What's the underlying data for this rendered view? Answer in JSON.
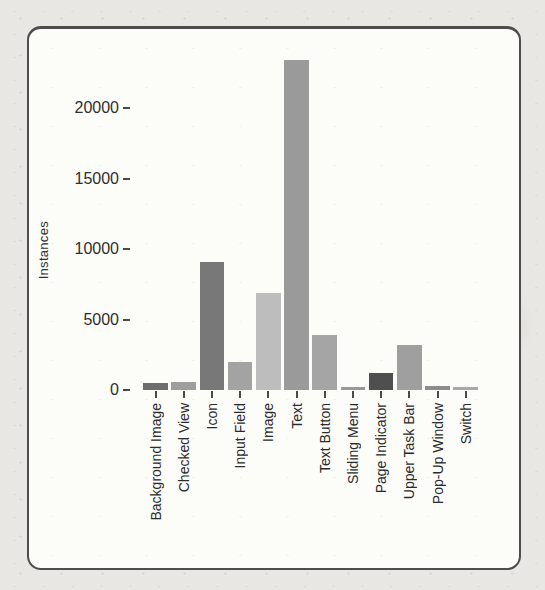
{
  "chart_data": {
    "type": "bar",
    "title": "",
    "xlabel": "",
    "ylabel": "Instances",
    "categories": [
      "Background Image",
      "Checked View",
      "Icon",
      "Input Field",
      "Image",
      "Text",
      "Text Button",
      "Sliding Menu",
      "Page Indicator",
      "Upper Task Bar",
      "Pop-Up Window",
      "Switch"
    ],
    "values": [
      500,
      600,
      9100,
      2000,
      6900,
      23400,
      3900,
      200,
      1200,
      3200,
      250,
      200
    ],
    "bar_colors": [
      "#6e6e6e",
      "#9e9e9e",
      "#787878",
      "#a3a3a3",
      "#bdbdbd",
      "#9a9a9a",
      "#a5a5a5",
      "#999999",
      "#4f4f4f",
      "#9f9f9f",
      "#8c8c8c",
      "#a8a8a8"
    ],
    "yticks": [
      {
        "value": 0,
        "label": "0"
      },
      {
        "value": 5000,
        "label": "5000"
      },
      {
        "value": 10000,
        "label": "10000"
      },
      {
        "value": 15000,
        "label": "15000"
      },
      {
        "value": 20000,
        "label": "20000"
      }
    ],
    "ylim": [
      0,
      24000
    ],
    "grid": false,
    "legend": false,
    "tick_color": "#4a4a4a",
    "text_color": "#2f2f2f"
  }
}
